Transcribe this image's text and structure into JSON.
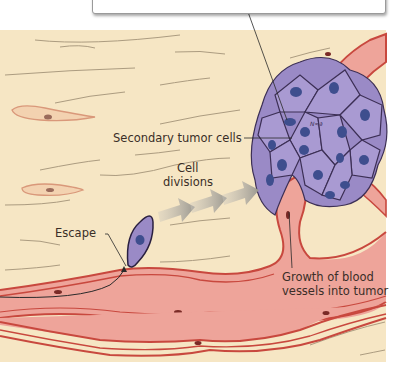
{
  "diagram": {
    "labels": {
      "secondary_tumor_cells": "Secondary tumor cells",
      "cell_divisions_line1": "Cell",
      "cell_divisions_line2": "divisions",
      "escape": "Escape",
      "growth_line1": "Growth of blood",
      "growth_line2": "vessels into tumor"
    },
    "callout_box": {
      "text_visible": ""
    },
    "colors": {
      "tissue": "#f6e6c4",
      "vessel_fill": "#eea49a",
      "vessel_wall": "#c8483e",
      "tumor_cell": "#9a8ac6",
      "tumor_nucleus": "#3e4e8e",
      "arrow": "#a8a8a0",
      "text": "#3a2e28"
    }
  }
}
